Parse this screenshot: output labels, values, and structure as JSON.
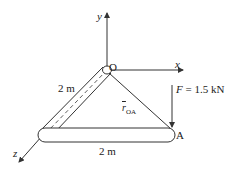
{
  "diagram": {
    "axes": {
      "x": "x",
      "y": "y",
      "z": "z"
    },
    "origin_label": "O",
    "point_label": "A",
    "force": {
      "symbol": "F",
      "value": "= 1.5 kN"
    },
    "vector": {
      "symbol": "r",
      "subscript": "OA"
    },
    "dimensions": {
      "diagonal": "2 m",
      "horizontal": "2 m"
    },
    "colors": {
      "line": "#333333",
      "fill": "#ffffff"
    }
  }
}
